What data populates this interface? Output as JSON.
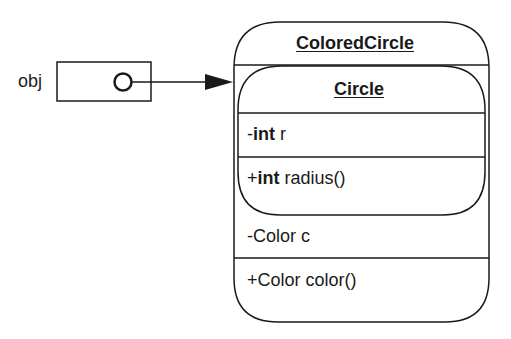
{
  "diagram": {
    "type": "uml-object-composition",
    "reference": {
      "label": "obj",
      "points_to": "ColoredCircle"
    },
    "outer_class": {
      "name": "ColoredCircle",
      "attributes": [
        {
          "visibility": "-",
          "type": "Color",
          "name": "c",
          "text": "-Color c"
        }
      ],
      "methods": [
        {
          "visibility": "+",
          "type": "Color",
          "name": "color()",
          "text": "+Color color()"
        }
      ]
    },
    "inner_class": {
      "name": "Circle",
      "attributes": [
        {
          "visibility": "-",
          "type": "int",
          "name": "r"
        }
      ],
      "methods": [
        {
          "visibility": "+",
          "type": "int",
          "name": "radius()"
        }
      ]
    }
  },
  "colors": {
    "stroke": "#1a1a1a",
    "background": "#ffffff"
  }
}
